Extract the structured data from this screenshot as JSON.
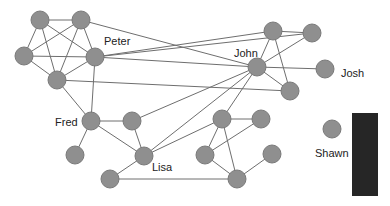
{
  "diagram": {
    "type": "social-network-graph",
    "colors": {
      "node": "#8f8f8f",
      "edge": "#6e6e6e",
      "label": "#222222",
      "panel": "#262626",
      "background": "#ffffff"
    },
    "node_radius": 9,
    "nodes": [
      {
        "id": "a",
        "x": 40,
        "y": 20,
        "label": ""
      },
      {
        "id": "b",
        "x": 81,
        "y": 20,
        "label": ""
      },
      {
        "id": "c",
        "x": 24,
        "y": 56,
        "label": ""
      },
      {
        "id": "peter",
        "x": 95,
        "y": 57,
        "label": "Peter",
        "lx": 104,
        "ly": 45
      },
      {
        "id": "e",
        "x": 57,
        "y": 80,
        "label": ""
      },
      {
        "id": "t1",
        "x": 273,
        "y": 31,
        "label": ""
      },
      {
        "id": "t2",
        "x": 312,
        "y": 33,
        "label": ""
      },
      {
        "id": "john",
        "x": 257,
        "y": 67,
        "label": "John",
        "lx": 234,
        "ly": 57
      },
      {
        "id": "josh",
        "x": 325,
        "y": 69,
        "label": "Josh",
        "lx": 341,
        "ly": 77
      },
      {
        "id": "r",
        "x": 290,
        "y": 91,
        "label": ""
      },
      {
        "id": "fred",
        "x": 91,
        "y": 121,
        "label": "Fred",
        "lx": 55,
        "ly": 126
      },
      {
        "id": "f2",
        "x": 132,
        "y": 121,
        "label": ""
      },
      {
        "id": "f3",
        "x": 75,
        "y": 155,
        "label": ""
      },
      {
        "id": "lisa",
        "x": 144,
        "y": 156,
        "label": "Lisa",
        "lx": 152,
        "ly": 171
      },
      {
        "id": "l2",
        "x": 110,
        "y": 179,
        "label": ""
      },
      {
        "id": "m1",
        "x": 222,
        "y": 119,
        "label": ""
      },
      {
        "id": "m2",
        "x": 261,
        "y": 119,
        "label": ""
      },
      {
        "id": "m3",
        "x": 205,
        "y": 155,
        "label": ""
      },
      {
        "id": "m4",
        "x": 272,
        "y": 154,
        "label": ""
      },
      {
        "id": "m5",
        "x": 237,
        "y": 179,
        "label": ""
      },
      {
        "id": "shawn",
        "x": 332,
        "y": 129,
        "label": "Shawn",
        "lx": 315,
        "ly": 157
      }
    ],
    "edges": [
      [
        "a",
        "b"
      ],
      [
        "a",
        "c"
      ],
      [
        "a",
        "peter"
      ],
      [
        "a",
        "e"
      ],
      [
        "b",
        "c"
      ],
      [
        "b",
        "peter"
      ],
      [
        "b",
        "e"
      ],
      [
        "c",
        "peter"
      ],
      [
        "c",
        "e"
      ],
      [
        "peter",
        "e"
      ],
      [
        "b",
        "john"
      ],
      [
        "peter",
        "t1"
      ],
      [
        "peter",
        "t2"
      ],
      [
        "peter",
        "john"
      ],
      [
        "e",
        "r"
      ],
      [
        "e",
        "fred"
      ],
      [
        "peter",
        "fred"
      ],
      [
        "t1",
        "t2"
      ],
      [
        "t1",
        "john"
      ],
      [
        "t2",
        "john"
      ],
      [
        "t1",
        "r"
      ],
      [
        "john",
        "josh"
      ],
      [
        "john",
        "r"
      ],
      [
        "fred",
        "f2"
      ],
      [
        "fred",
        "f3"
      ],
      [
        "fred",
        "lisa"
      ],
      [
        "f2",
        "lisa"
      ],
      [
        "lisa",
        "l2"
      ],
      [
        "l2",
        "m5"
      ],
      [
        "f2",
        "john"
      ],
      [
        "lisa",
        "john"
      ],
      [
        "lisa",
        "m1"
      ],
      [
        "m1",
        "john"
      ],
      [
        "m1",
        "m2"
      ],
      [
        "m1",
        "m3"
      ],
      [
        "m1",
        "m5"
      ],
      [
        "m2",
        "m3"
      ],
      [
        "m3",
        "m5"
      ],
      [
        "m4",
        "m5"
      ]
    ],
    "panel": {
      "x": 352,
      "y": 113,
      "width": 26,
      "height": 83
    }
  }
}
